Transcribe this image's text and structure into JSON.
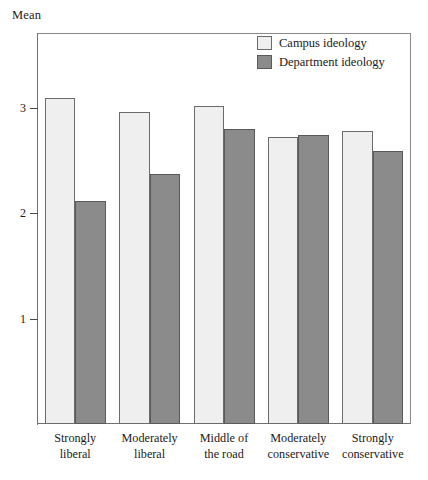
{
  "chart_data": {
    "type": "bar",
    "title": "",
    "xlabel": "",
    "ylabel": "Mean",
    "ylim": [
      0,
      3.7
    ],
    "yticks": [
      1,
      2,
      3
    ],
    "ytick_labels": [
      "1",
      "2",
      "3"
    ],
    "grid": false,
    "legend_position": "top-right",
    "categories": [
      "Strongly liberal",
      "Moderately liberal",
      "Middle of the road",
      "Moderately conservative",
      "Strongly conservative"
    ],
    "category_lines": [
      [
        "Strongly",
        "liberal"
      ],
      [
        "Moderately",
        "liberal"
      ],
      [
        "Middle of",
        "the road"
      ],
      [
        "Moderately",
        "conservative"
      ],
      [
        "Strongly",
        "conservative"
      ]
    ],
    "series": [
      {
        "name": "Campus ideology",
        "color": "#efefef",
        "values": [
          3.09,
          2.96,
          3.02,
          2.72,
          2.78
        ]
      },
      {
        "name": "Department ideology",
        "color": "#8b8b8b",
        "values": [
          2.12,
          2.37,
          2.8,
          2.74,
          2.59
        ]
      }
    ]
  },
  "axis": {
    "y_title": "Mean"
  },
  "legend": {
    "items": [
      {
        "label": "Campus ideology",
        "swatch": "light"
      },
      {
        "label": "Department ideology",
        "swatch": "dark"
      }
    ]
  }
}
